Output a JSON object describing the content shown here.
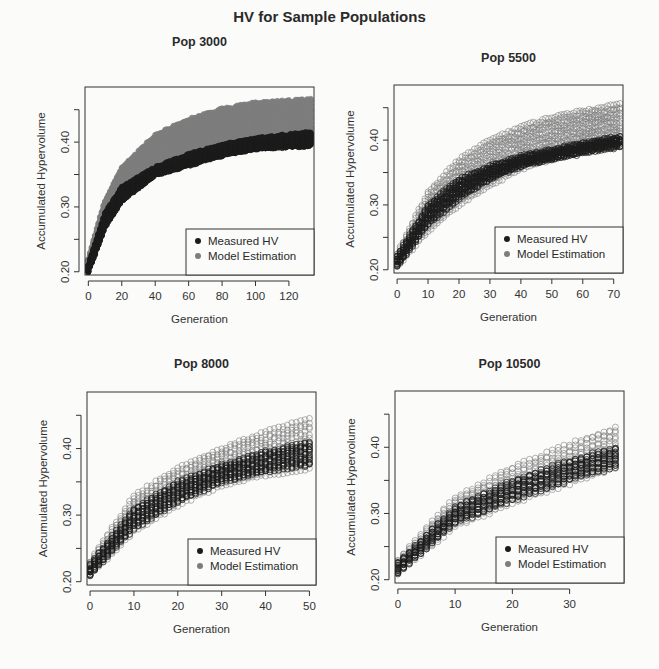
{
  "title": "HV for Sample Populations",
  "colors": {
    "measured": "#1c1c1c",
    "model": "#7d7d7d",
    "frame": "#333333",
    "background": "#fbfbfa"
  },
  "legend": {
    "items": [
      "Measured HV",
      "Model Estimation"
    ]
  },
  "chart_data": [
    {
      "type": "scatter",
      "title": "Pop 3000",
      "xlabel": "Generation",
      "ylabel": "Accumulated Hypervolume",
      "xticks": [
        0,
        20,
        40,
        60,
        80,
        100,
        120
      ],
      "yticks": [
        0.2,
        0.25,
        0.3,
        0.35,
        0.4,
        0.45
      ],
      "ytick_labels": [
        "0.20",
        "",
        "0.30",
        "",
        "0.40",
        ""
      ],
      "xlim": [
        -2,
        135
      ],
      "ylim": [
        0.195,
        0.485
      ],
      "legend_position": "bottomright",
      "series": [
        {
          "name": "Measured HV",
          "x": [
            0,
            10,
            20,
            40,
            60,
            80,
            100,
            133
          ],
          "y_low": [
            0.2,
            0.27,
            0.31,
            0.35,
            0.365,
            0.38,
            0.39,
            0.395
          ],
          "y_high": [
            0.21,
            0.29,
            0.33,
            0.36,
            0.38,
            0.395,
            0.405,
            0.415
          ]
        },
        {
          "name": "Model Estimation",
          "x": [
            0,
            10,
            20,
            40,
            60,
            80,
            100,
            133
          ],
          "y_low": [
            0.2,
            0.27,
            0.31,
            0.355,
            0.375,
            0.39,
            0.4,
            0.405
          ],
          "y_high": [
            0.22,
            0.31,
            0.36,
            0.41,
            0.435,
            0.45,
            0.46,
            0.465
          ]
        }
      ]
    },
    {
      "type": "scatter",
      "title": "Pop 5500",
      "xlabel": "Generation",
      "ylabel": "Accumulated Hypervolume",
      "xticks": [
        0,
        10,
        20,
        30,
        40,
        50,
        60,
        70
      ],
      "yticks": [
        0.2,
        0.25,
        0.3,
        0.35,
        0.4,
        0.45
      ],
      "ytick_labels": [
        "0.20",
        "",
        "0.30",
        "",
        "0.40",
        ""
      ],
      "xlim": [
        -1,
        73
      ],
      "ylim": [
        0.195,
        0.485
      ],
      "legend_position": "bottomright",
      "series": [
        {
          "name": "Measured HV",
          "x": [
            0,
            10,
            20,
            30,
            40,
            50,
            60,
            72
          ],
          "y_low": [
            0.205,
            0.27,
            0.31,
            0.34,
            0.36,
            0.37,
            0.38,
            0.39
          ],
          "y_high": [
            0.22,
            0.3,
            0.34,
            0.36,
            0.375,
            0.385,
            0.395,
            0.405
          ]
        },
        {
          "name": "Model Estimation",
          "x": [
            0,
            10,
            20,
            30,
            40,
            50,
            60,
            72
          ],
          "y_low": [
            0.205,
            0.26,
            0.3,
            0.33,
            0.355,
            0.37,
            0.385,
            0.395
          ],
          "y_high": [
            0.225,
            0.32,
            0.37,
            0.4,
            0.42,
            0.435,
            0.445,
            0.455
          ]
        }
      ]
    },
    {
      "type": "scatter",
      "title": "Pop 8000",
      "xlabel": "Generation",
      "ylabel": "Accumulated Hypervolume",
      "xticks": [
        0,
        10,
        20,
        30,
        40,
        50
      ],
      "yticks": [
        0.2,
        0.25,
        0.3,
        0.35,
        0.4,
        0.45
      ],
      "ytick_labels": [
        "0.20",
        "",
        "0.30",
        "",
        "0.40",
        ""
      ],
      "xlim": [
        -0.7,
        51.5
      ],
      "ylim": [
        0.195,
        0.485
      ],
      "legend_position": "bottomright",
      "series": [
        {
          "name": "Measured HV",
          "x": [
            0,
            10,
            20,
            30,
            40,
            50
          ],
          "y_low": [
            0.21,
            0.28,
            0.32,
            0.35,
            0.365,
            0.375
          ],
          "y_high": [
            0.225,
            0.31,
            0.35,
            0.375,
            0.395,
            0.41
          ]
        },
        {
          "name": "Model Estimation",
          "x": [
            0,
            10,
            20,
            30,
            40,
            50
          ],
          "y_low": [
            0.21,
            0.275,
            0.315,
            0.345,
            0.36,
            0.37
          ],
          "y_high": [
            0.23,
            0.33,
            0.37,
            0.4,
            0.425,
            0.445
          ]
        }
      ]
    },
    {
      "type": "scatter",
      "title": "Pop 10500",
      "xlabel": "Generation",
      "ylabel": "Accumulated Hypervolume",
      "xticks": [
        0,
        10,
        20,
        30
      ],
      "yticks": [
        0.2,
        0.25,
        0.3,
        0.35,
        0.4,
        0.45
      ],
      "ytick_labels": [
        "0.20",
        "",
        "0.30",
        "",
        "0.40",
        ""
      ],
      "xlim": [
        -0.5,
        39.5
      ],
      "ylim": [
        0.195,
        0.485
      ],
      "legend_position": "bottomright",
      "series": [
        {
          "name": "Measured HV",
          "x": [
            0,
            10,
            20,
            30,
            38
          ],
          "y_low": [
            0.21,
            0.285,
            0.32,
            0.35,
            0.37
          ],
          "y_high": [
            0.225,
            0.31,
            0.35,
            0.38,
            0.4
          ]
        },
        {
          "name": "Model Estimation",
          "x": [
            0,
            10,
            20,
            30,
            38
          ],
          "y_low": [
            0.21,
            0.28,
            0.315,
            0.345,
            0.37
          ],
          "y_high": [
            0.23,
            0.325,
            0.37,
            0.405,
            0.43
          ]
        }
      ]
    }
  ],
  "panels": [
    {
      "frame": [
        85,
        87,
        314,
        275
      ],
      "title_y": 46
    },
    {
      "frame": [
        394,
        85,
        623,
        273
      ],
      "title_y": 62
    },
    {
      "frame": [
        87,
        392,
        316,
        585
      ],
      "title_y": 368
    },
    {
      "frame": [
        395,
        391,
        624,
        583
      ],
      "title_y": 368
    }
  ]
}
